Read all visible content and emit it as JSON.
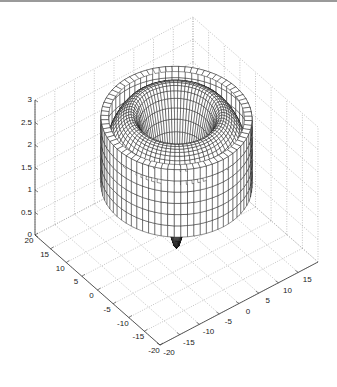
{
  "chart_data": {
    "type": "surface3d",
    "title": "",
    "xlabel": "",
    "ylabel": "",
    "zlabel": "",
    "xlim": [
      -20,
      20
    ],
    "ylim": [
      -20,
      20
    ],
    "zlim": [
      0,
      3
    ],
    "grid": true,
    "xticks": [
      -20,
      -15,
      -10,
      -5,
      0,
      5,
      10,
      15,
      20
    ],
    "xtick_labels": [
      "-20",
      "-15",
      "-10",
      "-5",
      "0",
      "5",
      "10",
      "15"
    ],
    "yticks": [
      20,
      15,
      10,
      5,
      0,
      -5,
      -10,
      -15,
      -20
    ],
    "ytick_labels": [
      "20",
      "15",
      "10",
      "5",
      "0",
      "-5",
      "-10",
      "-15",
      "-20"
    ],
    "zticks": [
      0,
      0.5,
      1,
      1.5,
      2,
      2.5,
      3
    ],
    "ztick_labels": [
      "0",
      "0.5",
      "1",
      "1.5",
      "2",
      "2.5",
      "3"
    ],
    "surface": {
      "description": "Mesh surface of revolution: a flat-topped outer cylindrical band (radius ~15, z ~1.4 to 2.9), a curved toroidal inner dome (peak z ~3 at radius ~9) descending into a central hole, and a downward cusp below the center reaching z ~0.",
      "style": "wireframe mesh, black edges, white faces",
      "outer_radius": 15,
      "outer_top_z": 2.9,
      "outer_bottom_z": 1.4,
      "dome_peak_radius": 9,
      "dome_peak_z": 3.0,
      "inner_hole_radius": 5,
      "inner_hole_z": 1.5,
      "cusp_tip_z": 0.0
    },
    "view": {
      "azimuth": -45,
      "elevation": 40
    }
  },
  "colors": {
    "axis": "#333333",
    "grid": "#9a9a9a",
    "mesh": "#111111",
    "face": "#ffffff",
    "frame_top": "#9a9a9a"
  }
}
